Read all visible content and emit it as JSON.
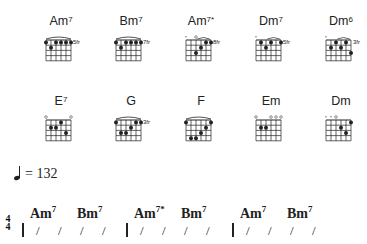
{
  "chord_library": {
    "rows": [
      [
        {
          "root": "Am",
          "ext": "7",
          "fret_label": "5fr",
          "mutes": "",
          "opens": "",
          "barre": true,
          "dots": [
            [
              0,
              0
            ],
            [
              0,
              2
            ],
            [
              0,
              3
            ],
            [
              0,
              4
            ],
            [
              0,
              5
            ],
            [
              1,
              1
            ]
          ]
        },
        {
          "root": "Bm",
          "ext": "7",
          "fret_label": "7fr",
          "mutes": "",
          "opens": "",
          "barre": true,
          "dots": [
            [
              0,
              0
            ],
            [
              0,
              2
            ],
            [
              0,
              3
            ],
            [
              0,
              4
            ],
            [
              0,
              5
            ],
            [
              1,
              1
            ]
          ]
        },
        {
          "root": "Am",
          "ext": "7*",
          "fret_label": "8fr",
          "mutes": "x o",
          "opens": "",
          "barre": false,
          "dots": [
            [
              0,
              4
            ],
            [
              0,
              5
            ],
            [
              1,
              3
            ],
            [
              2,
              2
            ]
          ]
        },
        {
          "root": "Dm",
          "ext": "7",
          "fret_label": "5fr",
          "mutes": "x",
          "opens": "",
          "barre": false,
          "dots": [
            [
              0,
              1
            ],
            [
              0,
              3
            ],
            [
              0,
              5
            ],
            [
              1,
              2
            ]
          ]
        },
        {
          "root": "Dm",
          "ext": "6",
          "fret_label": "3fr",
          "mutes": "x",
          "opens": "",
          "barre": false,
          "dots": [
            [
              0,
              2
            ],
            [
              0,
              4
            ],
            [
              1,
              1
            ],
            [
              1,
              3
            ],
            [
              2,
              5
            ]
          ]
        }
      ],
      [
        {
          "root": "E",
          "ext": "7",
          "fret_label": "",
          "mutes": "",
          "opens": "o    o",
          "barre": false,
          "dots": [
            [
              0,
              3
            ],
            [
              1,
              1
            ],
            [
              1,
              2
            ],
            [
              2,
              4
            ]
          ]
        },
        {
          "root": "G",
          "ext": "",
          "fret_label": "3fr",
          "mutes": "",
          "opens": "",
          "barre": true,
          "dots": [
            [
              0,
              0
            ],
            [
              0,
              4
            ],
            [
              0,
              5
            ],
            [
              1,
              3
            ],
            [
              2,
              1
            ],
            [
              2,
              2
            ]
          ]
        },
        {
          "root": "F",
          "ext": "",
          "fret_label": "",
          "mutes": "",
          "opens": "",
          "barre": true,
          "dots": [
            [
              0,
              0
            ],
            [
              0,
              5
            ],
            [
              1,
              4
            ],
            [
              2,
              3
            ],
            [
              3,
              1
            ],
            [
              3,
              2
            ]
          ]
        },
        {
          "root": "Em",
          "ext": "",
          "fret_label": "",
          "mutes": "",
          "opens": "o  ooo",
          "barre": false,
          "dots": [
            [
              1,
              1
            ],
            [
              1,
              2
            ]
          ]
        },
        {
          "root": "Dm",
          "ext": "",
          "fret_label": "",
          "mutes": "xxo",
          "opens": "",
          "barre": false,
          "dots": [
            [
              0,
              5
            ],
            [
              1,
              3
            ],
            [
              2,
              4
            ]
          ]
        }
      ]
    ]
  },
  "tempo": {
    "value": "= 132"
  },
  "time_signature": {
    "top": "4",
    "bottom": "4"
  },
  "measures": [
    {
      "chords": [
        {
          "root": "Am",
          "ext": "7"
        },
        {
          "root": "Bm",
          "ext": "7"
        }
      ],
      "slashes": 4
    },
    {
      "chords": [
        {
          "root": "Am",
          "ext": "7*"
        },
        {
          "root": "Bm",
          "ext": "7"
        }
      ],
      "slashes": 4
    },
    {
      "chords": [
        {
          "root": "Am",
          "ext": "7"
        },
        {
          "root": "Bm",
          "ext": "7"
        }
      ],
      "slashes": 4
    }
  ],
  "colors": {
    "ink": "#222222",
    "background": "#ffffff"
  }
}
